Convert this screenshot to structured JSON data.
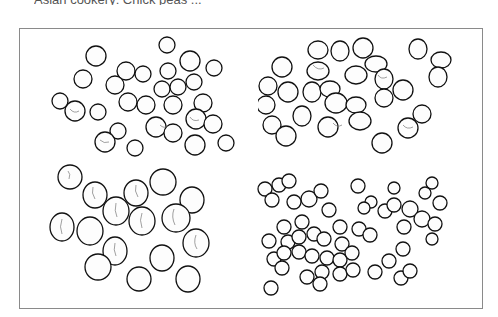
{
  "page": {
    "caption_fragment": "Asian cookery: Chick peas ...",
    "caption_visible_state": "clipped at top edge"
  },
  "illustration": {
    "description": "Pen-and-ink drawing of four groups of legumes inside a rectangular frame",
    "border_color": "#8a8a8a",
    "quadrants": [
      {
        "id": "top-left",
        "shape": "round",
        "approx_count": 33
      },
      {
        "id": "top-right",
        "shape": "oval",
        "approx_count": 32
      },
      {
        "id": "bottom-left",
        "shape": "large wrinkled",
        "approx_count": 18
      },
      {
        "id": "bottom-right",
        "shape": "small round",
        "approx_count": 60
      }
    ]
  }
}
